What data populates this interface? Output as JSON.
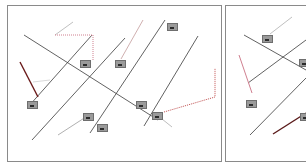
{
  "diagram": {
    "panels": [
      {
        "id": "panel1",
        "label": ""
      },
      {
        "id": "panel2",
        "label": ""
      }
    ],
    "colors": {
      "line": "#3a3a3a",
      "frame": "#8a8a8a",
      "leader_gray": "#b0b0b0",
      "leader_pink": "#d9a0a8",
      "leader_darkred": "#7a1e1e",
      "leader_dotted_red": "#c05050",
      "tag_fill": "#9a9a9a"
    },
    "tags": [
      {
        "x": 80,
        "y": 60
      },
      {
        "x": 115,
        "y": 60
      },
      {
        "x": 27,
        "y": 101
      },
      {
        "x": 83,
        "y": 113
      },
      {
        "x": 97,
        "y": 120
      },
      {
        "x": 136,
        "y": 101
      },
      {
        "x": 152,
        "y": 112
      },
      {
        "x": 167,
        "y": 23
      },
      {
        "x": 155,
        "y": 114
      },
      {
        "x": 262,
        "y": 35
      },
      {
        "x": 299,
        "y": 59
      },
      {
        "x": 246,
        "y": 97
      },
      {
        "x": 300,
        "y": 113
      }
    ]
  }
}
